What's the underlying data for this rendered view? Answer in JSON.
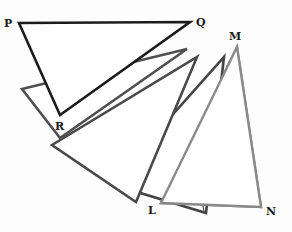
{
  "diagram": {
    "labels": {
      "P": "P",
      "Q": "Q",
      "R": "R",
      "L": "L",
      "M": "M",
      "N": "N"
    },
    "colors": {
      "pqr_stroke": "#1c1c1c",
      "step2_stroke": "#505050",
      "step3_stroke": "#4a4a4a",
      "step4_stroke": "#444444",
      "lmn_stroke": "#8a8a8a",
      "fill": "#ffffff"
    },
    "triangles": [
      {
        "name": "triangle-pqr",
        "points": "19,23 190,22 60,115"
      },
      {
        "name": "triangle-rotation-2",
        "points": "22,89 187,49 60,138"
      },
      {
        "name": "triangle-rotation-3",
        "points": "52,145 197,57 136,202"
      },
      {
        "name": "triangle-rotation-4",
        "points": "111,184 224,57 206,213"
      },
      {
        "name": "triangle-lmn",
        "points": "161,203 237,47 261,207"
      }
    ]
  }
}
